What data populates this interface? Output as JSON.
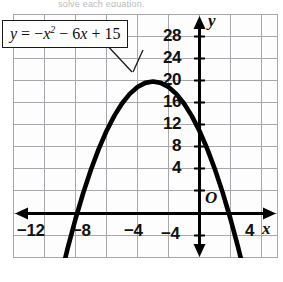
{
  "page": {
    "cropped_header_text": "solve each equation."
  },
  "callout": {
    "equation_text": "y = -x² - 6x + 15",
    "parts": {
      "y": "y",
      "eq": "=",
      "neg": "−",
      "x": "x",
      "exp": "2",
      "minus6x": "− 6",
      "x2": "x",
      "plus15": "+ 15"
    }
  },
  "axes": {
    "x_axis_name": "x",
    "y_axis_name": "y",
    "origin_label": "O",
    "x_ticks": [
      "−12",
      "−8",
      "−4",
      "4"
    ],
    "y_ticks": [
      "28",
      "24",
      "20",
      "16",
      "12",
      "8",
      "4",
      "−4"
    ]
  },
  "colors": {
    "curve": "#000000",
    "axis": "#000000",
    "grid": "#a8a8ac",
    "background": "#fdfdfd",
    "text": "#111111"
  },
  "chart_data": {
    "type": "line",
    "title": "",
    "subtitle": "",
    "xlabel": "x",
    "ylabel": "y",
    "equation": "y = -x^2 - 6x + 15",
    "curve_kind": "parabola",
    "opens": "down",
    "vertex": [
      -3,
      24
    ],
    "y_intercept": 15,
    "x_intercepts": [
      -7.899,
      1.899
    ],
    "axis_of_symmetry": -3,
    "grid": true,
    "grid_spacing": {
      "x": 2,
      "y": 4
    },
    "legend": "none",
    "xlim": [
      -14,
      4.8
    ],
    "ylim": [
      -8,
      33
    ],
    "xticks": [
      -12,
      -8,
      -4,
      4
    ],
    "yticks": [
      4,
      8,
      12,
      16,
      20,
      24,
      28,
      -4
    ],
    "series": [
      {
        "name": "y = -x^2 - 6x + 15",
        "x": [
          -9.2,
          -9.0,
          -8.5,
          -8.0,
          -7.5,
          -7.0,
          -6.5,
          -6.0,
          -5.5,
          -5.0,
          -4.5,
          -4.0,
          -3.5,
          -3.0,
          -2.5,
          -2.0,
          -1.5,
          -1.0,
          -0.5,
          0.0,
          0.5,
          1.0,
          1.5,
          2.0,
          2.5,
          3.0,
          3.2
        ],
        "y": [
          -14.4,
          -12.0,
          -6.25,
          -1.0,
          3.75,
          8.0,
          11.75,
          15.0,
          17.75,
          20.0,
          21.75,
          23.0,
          23.75,
          24.0,
          23.75,
          23.0,
          21.75,
          20.0,
          17.75,
          15.0,
          11.75,
          8.0,
          3.75,
          -1.0,
          -6.25,
          -12.0,
          -14.44
        ]
      }
    ]
  }
}
